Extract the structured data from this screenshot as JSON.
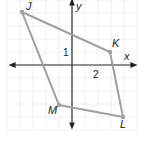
{
  "figure": {
    "axes": {
      "x_label": "x",
      "y_label": "y",
      "tick_label_x": "2",
      "tick_label_y": "1"
    },
    "points": [
      {
        "name": "J",
        "x": -4,
        "y": 4
      },
      {
        "name": "K",
        "x": 3,
        "y": 1
      },
      {
        "name": "L",
        "x": 4,
        "y": -4
      },
      {
        "name": "M",
        "x": -1,
        "y": -3
      }
    ],
    "shape": "quadrilateral JKLM",
    "colors": {
      "polygon": "#a0a0a0",
      "axis": "#222222",
      "grid": "#e6e6e6"
    }
  }
}
